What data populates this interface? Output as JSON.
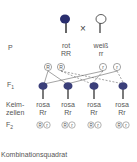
{
  "rows": {
    "p": "P",
    "f1": "F",
    "f1_sub": "1",
    "keim1": "Keim-",
    "keim2": "zellen",
    "f2": "F",
    "f2_sub": "2"
  },
  "parents": {
    "left": {
      "color_name": "rot",
      "genotype": "RR",
      "flower_color": "#2a2e6e"
    },
    "cross": "×",
    "right": {
      "color_name": "weiß",
      "genotype": "rr",
      "flower_color": "#ffffff"
    }
  },
  "gametes_parent": [
    "R",
    "R",
    "r",
    "r"
  ],
  "f1_plants": [
    {
      "color_name": "rosa",
      "genotype": "Rr",
      "gametes": [
        "R",
        "r"
      ]
    },
    {
      "color_name": "rosa",
      "genotype": "Rr",
      "gametes": [
        "R",
        "r"
      ]
    },
    {
      "color_name": "rosa",
      "genotype": "Rr",
      "gametes": [
        "R",
        "r"
      ]
    },
    {
      "color_name": "rosa",
      "genotype": "Rr",
      "gametes": [
        "R",
        "r"
      ]
    }
  ],
  "caption": "Kombinationsquadrat",
  "colors": {
    "dark_flower": "#2a2e6e",
    "line": "#666666",
    "text": "#555555"
  }
}
